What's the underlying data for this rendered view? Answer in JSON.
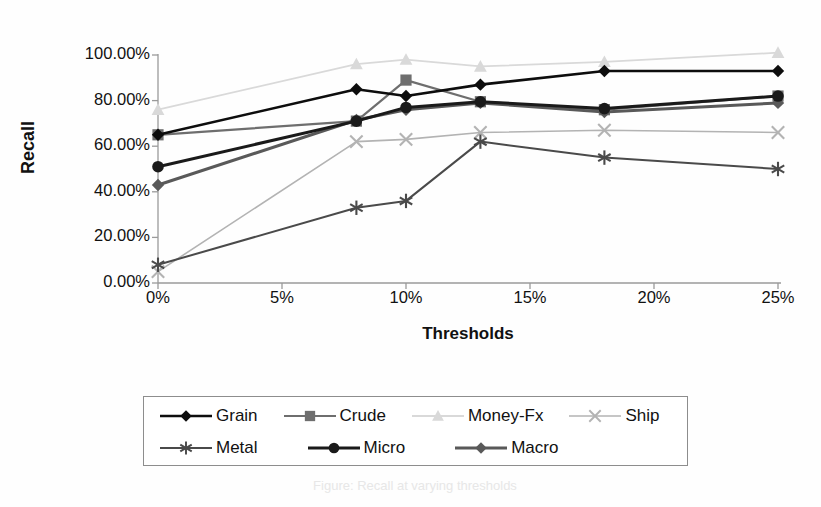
{
  "figure": {
    "background": "#fefefe",
    "plot_area": {
      "left": 158,
      "top": 55,
      "right": 778,
      "bottom": 283
    }
  },
  "axis_titles": {
    "y": "Recall",
    "x": "Thresholds"
  },
  "legend": {
    "rows": [
      [
        {
          "name": "Grain",
          "marker": "diamond",
          "color": "#0d0d0d",
          "line_width": 2.6
        },
        {
          "name": "Crude",
          "marker": "square",
          "color": "#6e6e6e",
          "line_width": 2.2
        },
        {
          "name": "Money-Fx",
          "marker": "triangle",
          "color": "#d9d9d9",
          "line_width": 1.8
        },
        {
          "name": "Ship",
          "marker": "cross",
          "color": "#b3b3b3",
          "line_width": 1.6
        }
      ],
      [
        {
          "name": "Metal",
          "marker": "asterisk",
          "color": "#4a4a4a",
          "line_width": 2.0
        },
        {
          "name": "Micro",
          "marker": "circle",
          "color": "#1a1a1a",
          "line_width": 3.0
        },
        {
          "name": "Macro",
          "marker": "diamond",
          "color": "#595959",
          "line_width": 3.0
        }
      ]
    ]
  },
  "scan_caption": "Figure: Recall at varying thresholds",
  "chart_data": {
    "type": "line",
    "title": "",
    "xlabel": "Thresholds",
    "ylabel": "Recall",
    "x": [
      0,
      8,
      10,
      13,
      18,
      25
    ],
    "xtick_labels": [
      "0%",
      "5%",
      "10%",
      "15%",
      "20%",
      "25%"
    ],
    "xtick_values": [
      0,
      5,
      10,
      15,
      20,
      25
    ],
    "xlim": [
      0,
      25
    ],
    "ytick_labels": [
      "0.00%",
      "20.00%",
      "40.00%",
      "60.00%",
      "80.00%",
      "100.00%"
    ],
    "ytick_values": [
      0,
      20,
      40,
      60,
      80,
      100
    ],
    "ylim": [
      0,
      100
    ],
    "grid": false,
    "legend_position": "bottom",
    "series": [
      {
        "name": "Grain",
        "marker": "diamond",
        "color": "#0d0d0d",
        "line_width": 2.6,
        "values": [
          65.0,
          85.0,
          82.0,
          87.0,
          93.0,
          93.0
        ]
      },
      {
        "name": "Crude",
        "marker": "square",
        "color": "#6e6e6e",
        "line_width": 2.2,
        "values": [
          65.0,
          71.0,
          89.0,
          79.5,
          76.0,
          82.0
        ]
      },
      {
        "name": "Money-Fx",
        "marker": "triangle",
        "color": "#d9d9d9",
        "line_width": 1.8,
        "values": [
          76.0,
          96.0,
          98.0,
          95.0,
          97.0,
          101.0
        ]
      },
      {
        "name": "Ship",
        "marker": "cross",
        "color": "#b3b3b3",
        "line_width": 1.6,
        "values": [
          5.0,
          62.0,
          63.0,
          66.0,
          67.0,
          66.0
        ]
      },
      {
        "name": "Metal",
        "marker": "asterisk",
        "color": "#4a4a4a",
        "line_width": 2.0,
        "values": [
          8.0,
          33.0,
          36.0,
          62.0,
          55.0,
          50.0
        ]
      },
      {
        "name": "Micro",
        "marker": "circle",
        "color": "#1a1a1a",
        "line_width": 3.0,
        "values": [
          51.0,
          71.0,
          77.0,
          79.5,
          76.5,
          82.0
        ]
      },
      {
        "name": "Macro",
        "marker": "diamond",
        "color": "#595959",
        "line_width": 3.0,
        "values": [
          43.0,
          71.5,
          76.0,
          79.0,
          75.0,
          79.0
        ]
      }
    ]
  }
}
